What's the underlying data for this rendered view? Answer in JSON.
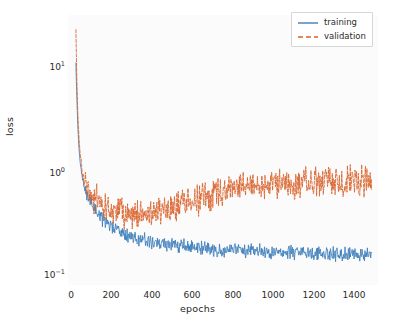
{
  "chart_data": {
    "type": "line",
    "title": "",
    "xlabel": "epochs",
    "ylabel": "loss",
    "yscale": "log",
    "xscale": "linear",
    "xlim": [
      -40,
      1530
    ],
    "ylim": [
      0.085,
      42
    ],
    "grid": false,
    "legend_position": "upper right",
    "xticks": [
      "0",
      "200",
      "400",
      "600",
      "800",
      "1000",
      "1200",
      "1400"
    ],
    "xtick_values": [
      0,
      200,
      400,
      600,
      800,
      1000,
      1200,
      1400
    ],
    "ytick_labels": [
      "10¹",
      "10⁰",
      "10⁻¹"
    ],
    "ytick_values": [
      10,
      1,
      0.1
    ],
    "series": [
      {
        "name": "training",
        "color": "#3d7ebb",
        "linestyle": "solid",
        "x": [
          0,
          5,
          10,
          15,
          20,
          30,
          40,
          50,
          60,
          70,
          80,
          90,
          100,
          120,
          140,
          160,
          180,
          200,
          250,
          300,
          350,
          400,
          450,
          500,
          600,
          700,
          800,
          900,
          1000,
          1100,
          1200,
          1300,
          1400,
          1500
        ],
        "values": [
          14.0,
          6.0,
          3.2,
          2.0,
          1.5,
          1.05,
          0.85,
          0.72,
          0.65,
          0.58,
          0.54,
          0.5,
          0.47,
          0.42,
          0.38,
          0.35,
          0.33,
          0.305,
          0.27,
          0.25,
          0.235,
          0.225,
          0.215,
          0.21,
          0.2,
          0.195,
          0.19,
          0.185,
          0.182,
          0.18,
          0.177,
          0.175,
          0.173,
          0.172
        ],
        "noise_log_amplitude": 0.055,
        "final_value": 0.17
      },
      {
        "name": "validation",
        "color": "#d9622b",
        "linestyle": "dashed",
        "x": [
          0,
          5,
          10,
          15,
          20,
          30,
          40,
          50,
          60,
          70,
          80,
          90,
          100,
          120,
          140,
          160,
          180,
          200,
          250,
          300,
          350,
          400,
          450,
          500,
          550,
          600,
          650,
          700,
          750,
          800,
          850,
          900,
          1000,
          1100,
          1200,
          1300,
          1400,
          1500
        ],
        "values": [
          30.0,
          9.0,
          4.2,
          2.6,
          1.9,
          1.25,
          1.0,
          0.88,
          0.8,
          0.73,
          0.68,
          0.64,
          0.61,
          0.56,
          0.52,
          0.49,
          0.47,
          0.45,
          0.425,
          0.42,
          0.435,
          0.46,
          0.49,
          0.52,
          0.56,
          0.6,
          0.64,
          0.68,
          0.72,
          0.77,
          0.8,
          0.83,
          0.865,
          0.885,
          0.9,
          0.915,
          0.925,
          0.93
        ],
        "noise_log_amplitude": 0.115,
        "final_value": 0.93
      }
    ]
  },
  "legend": {
    "items": [
      {
        "label": "training",
        "color": "#3d7ebb",
        "style": "solid"
      },
      {
        "label": "validation",
        "color": "#d9622b",
        "style": "dashed"
      }
    ]
  },
  "axis_labels": {
    "x": "epochs",
    "y": "loss"
  }
}
